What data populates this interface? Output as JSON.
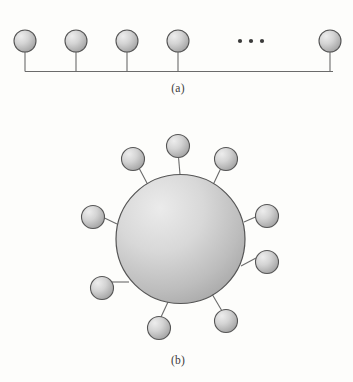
{
  "figure": {
    "background_color": "#fdfdfb",
    "node_fill_light": "#e8e8e8",
    "node_fill_dark": "#9a9a9a",
    "node_stroke": "#555555",
    "link_stroke": "#6b6b6b",
    "ellipsis_color": "#3a3a3a",
    "panels": [
      {
        "id": "a",
        "caption": "(a)",
        "topology": "bus",
        "caption_x": 178,
        "caption_y": 92,
        "bus_line": {
          "x1": 25,
          "x2": 333,
          "y": 71.5
        },
        "node_radius": 11,
        "nodes": [
          {
            "name": "bus-node-1",
            "cx": 25,
            "cy": 41,
            "stem_x": 25,
            "stem_y1": 52,
            "stem_y2": 71.5
          },
          {
            "name": "bus-node-2",
            "cx": 76,
            "cy": 41,
            "stem_x": 76,
            "stem_y1": 52,
            "stem_y2": 71.5
          },
          {
            "name": "bus-node-3",
            "cx": 127,
            "cy": 41,
            "stem_x": 127,
            "stem_y1": 52,
            "stem_y2": 71.5
          },
          {
            "name": "bus-node-4",
            "cx": 178,
            "cy": 41,
            "stem_x": 178,
            "stem_y1": 52,
            "stem_y2": 71.5
          },
          {
            "name": "bus-node-5",
            "cx": 330,
            "cy": 41,
            "stem_x": 330,
            "stem_y1": 52,
            "stem_y2": 71.5
          }
        ],
        "ellipsis": {
          "name": "bus-ellipsis",
          "label": "...",
          "dots": [
            {
              "cx": 240,
              "cy": 41
            },
            {
              "cx": 251,
              "cy": 41
            },
            {
              "cx": 262,
              "cy": 41
            }
          ],
          "dot_radius": 2.1
        }
      },
      {
        "id": "b",
        "caption": "(b)",
        "topology": "star",
        "caption_x": 178,
        "caption_y": 364,
        "hub": {
          "name": "star-hub",
          "cx": 180.5,
          "cy": 239,
          "r": 64.5
        },
        "node_radius": 11.5,
        "nodes": [
          {
            "name": "star-node-1",
            "cx": 178,
            "cy": 146,
            "link_x1": 178.5,
            "link_y1": 157,
            "link_x2": 180,
            "link_y2": 174.5
          },
          {
            "name": "star-node-2",
            "cx": 226,
            "cy": 159,
            "link_x1": 221,
            "link_y1": 168,
            "link_x2": 213,
            "link_y2": 185
          },
          {
            "name": "star-node-3",
            "cx": 133,
            "cy": 159,
            "link_x1": 139,
            "link_y1": 168,
            "link_x2": 148,
            "link_y2": 185
          },
          {
            "name": "star-node-4",
            "cx": 267,
            "cy": 216,
            "link_x1": 255.5,
            "link_y1": 217,
            "link_x2": 244,
            "link_y2": 222
          },
          {
            "name": "star-node-5",
            "cx": 93,
            "cy": 217,
            "link_x1": 104.5,
            "link_y1": 218,
            "link_x2": 117,
            "link_y2": 224
          },
          {
            "name": "star-node-6",
            "cx": 267,
            "cy": 262,
            "link_x1": 256,
            "link_y1": 258,
            "link_x2": 241,
            "link_y2": 266
          },
          {
            "name": "star-node-7",
            "cx": 102,
            "cy": 288,
            "link_x1": 112,
            "link_y1": 282,
            "link_x2": 129,
            "link_y2": 282
          },
          {
            "name": "star-node-8",
            "cx": 226,
            "cy": 321,
            "link_x1": 222,
            "link_y1": 311,
            "link_x2": 212,
            "link_y2": 294
          },
          {
            "name": "star-node-9",
            "cx": 159,
            "cy": 328,
            "link_x1": 161,
            "link_y1": 317,
            "link_x2": 168,
            "link_y2": 302
          }
        ]
      }
    ]
  }
}
